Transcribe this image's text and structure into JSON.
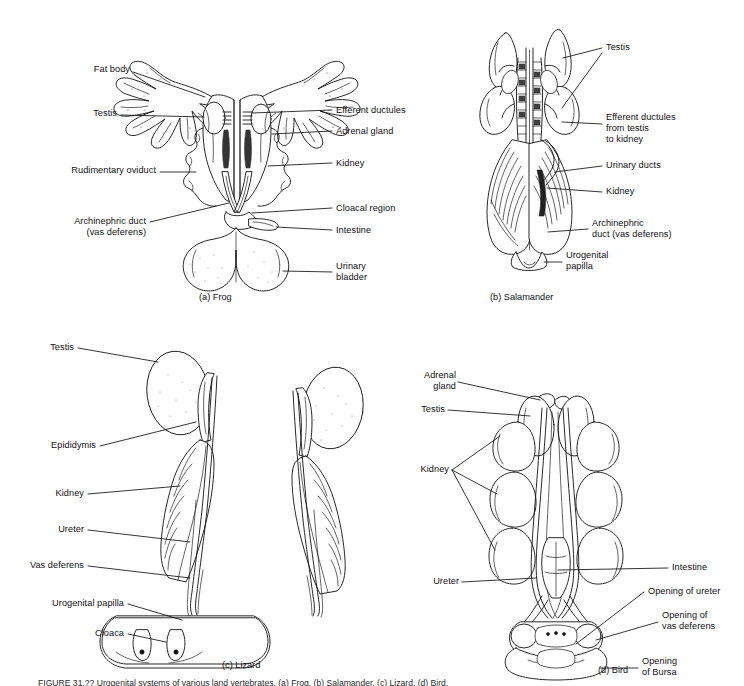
{
  "figure": {
    "background": "#ffffff",
    "ink_color": "#111111",
    "caption_partial": "FIGURE 31.?? Urogenital systems of various land vertebrates. (a) Frog. (b) Salamander. (c) Lizard. (d) Bird."
  },
  "panels": [
    {
      "id": "frog",
      "caption": "(a) Frog",
      "labels_left": [
        {
          "name": "fat-body",
          "text": "Fat body"
        },
        {
          "name": "testis",
          "text": "Testis"
        },
        {
          "name": "rudimentary-oviduct",
          "text": "Rudimentary oviduct"
        },
        {
          "name": "archinephric-duct",
          "text": "Archinephric duct\n(vas deferens)"
        }
      ],
      "labels_right": [
        {
          "name": "efferent-ductules",
          "text": "Efferent ductules"
        },
        {
          "name": "adrenal-gland",
          "text": "Adrenal gland"
        },
        {
          "name": "kidney",
          "text": "Kidney"
        },
        {
          "name": "cloacal-region",
          "text": "Cloacal region"
        },
        {
          "name": "intestine",
          "text": "Intestine"
        },
        {
          "name": "urinary-bladder",
          "text": "Urinary\nbladder"
        }
      ]
    },
    {
      "id": "salamander",
      "caption": "(b) Salamander",
      "labels_right": [
        {
          "name": "testis",
          "text": "Testis"
        },
        {
          "name": "efferent-ductules",
          "text": "Efferent ductules\nfrom testis\nto kidney"
        },
        {
          "name": "urinary-ducts",
          "text": "Urinary ducts"
        },
        {
          "name": "kidney",
          "text": "Kidney"
        },
        {
          "name": "archinephric-duct",
          "text": "Archinephric\nduct (vas deferens)"
        },
        {
          "name": "urogenital-papilla",
          "text": "Urogenital\npapilla"
        }
      ]
    },
    {
      "id": "lizard",
      "caption": "(c) Lizard",
      "labels_left": [
        {
          "name": "testis",
          "text": "Testis"
        },
        {
          "name": "epididymis",
          "text": "Epididymis"
        },
        {
          "name": "kidney",
          "text": "Kidney"
        },
        {
          "name": "ureter",
          "text": "Ureter"
        },
        {
          "name": "vas-deferens",
          "text": "Vas deferens"
        },
        {
          "name": "urogenital-papilla",
          "text": "Urogenital papilla"
        },
        {
          "name": "cloaca",
          "text": "Cloaca"
        }
      ]
    },
    {
      "id": "bird",
      "caption": "(d) Bird",
      "labels_left": [
        {
          "name": "adrenal-gland",
          "text": "Adrenal\ngland"
        },
        {
          "name": "testis",
          "text": "Testis"
        },
        {
          "name": "kidney",
          "text": "Kidney"
        },
        {
          "name": "ureter",
          "text": "Ureter"
        }
      ],
      "labels_right": [
        {
          "name": "intestine",
          "text": "Intestine"
        },
        {
          "name": "opening-of-ureter",
          "text": "Opening of ureter"
        },
        {
          "name": "opening-vas-deferens",
          "text": "Opening of\nvas deferens"
        },
        {
          "name": "opening-of-bursa",
          "text": "Opening\nof Bursa"
        }
      ]
    }
  ]
}
